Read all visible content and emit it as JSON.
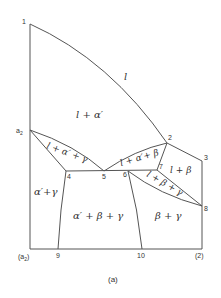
{
  "diagram": {
    "caption": "(a)",
    "axis": {
      "left_label": "(a2)",
      "right_label": "(2)"
    },
    "points": {
      "p1": "1",
      "a2": "a2",
      "p2": "2",
      "p3": "3",
      "p4": "4",
      "p5": "5",
      "p6": "6",
      "p7": "7",
      "p8": "8",
      "p9": "9",
      "p10": "10"
    },
    "regions": {
      "liquid": "l",
      "l_alpha": "l + α′",
      "l_alpha_gamma": "l + α′ + γ",
      "l_alpha_beta": "l + α′+ β",
      "l_beta": "l + β",
      "l_beta_gamma": "l + β + γ",
      "alpha_gamma": "α′+γ",
      "alpha_beta_gamma": "α′ + β + γ",
      "beta_gamma": "β + γ"
    }
  }
}
